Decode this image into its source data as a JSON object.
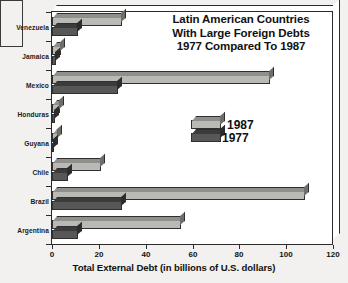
{
  "chart_data": {
    "type": "bar",
    "orientation": "horizontal",
    "title": "Latin American Countries With Large Foreign Debts 1977 Compared To 1987",
    "title_lines": [
      "Latin American Countries",
      "With Large Foreign Debts",
      "1977 Compared To 1987"
    ],
    "xlabel": "Total External Debt (in billions of U.S. dollars)",
    "ylabel": "",
    "xlim": [
      0,
      120
    ],
    "xticks": [
      0,
      20,
      40,
      60,
      80,
      100,
      120
    ],
    "xtick_labels": [
      "0",
      "20",
      "40",
      "60",
      "80",
      "100",
      "120"
    ],
    "grid": false,
    "legend_position": "center-right-inside",
    "categories": [
      "Venezuela",
      "Jamaica",
      "Mexico",
      "Honduras",
      "Guyana",
      "Chile",
      "Brazil",
      "Argentina"
    ],
    "series": [
      {
        "name": "1987",
        "color": "#b9b9b5",
        "values": [
          30,
          4,
          93,
          3.5,
          2.5,
          21,
          108,
          55
        ]
      },
      {
        "name": "1977",
        "color": "#575757",
        "values": [
          11,
          1.5,
          28,
          1.2,
          0.8,
          7,
          30,
          11
        ]
      }
    ]
  },
  "colors": {
    "background": "#f2f1ef",
    "plot_background": "#ffffff",
    "axis": "#2b2b2b",
    "bar_1987": "#b9b9b5",
    "bar_1977": "#575757",
    "text": "#111111"
  }
}
